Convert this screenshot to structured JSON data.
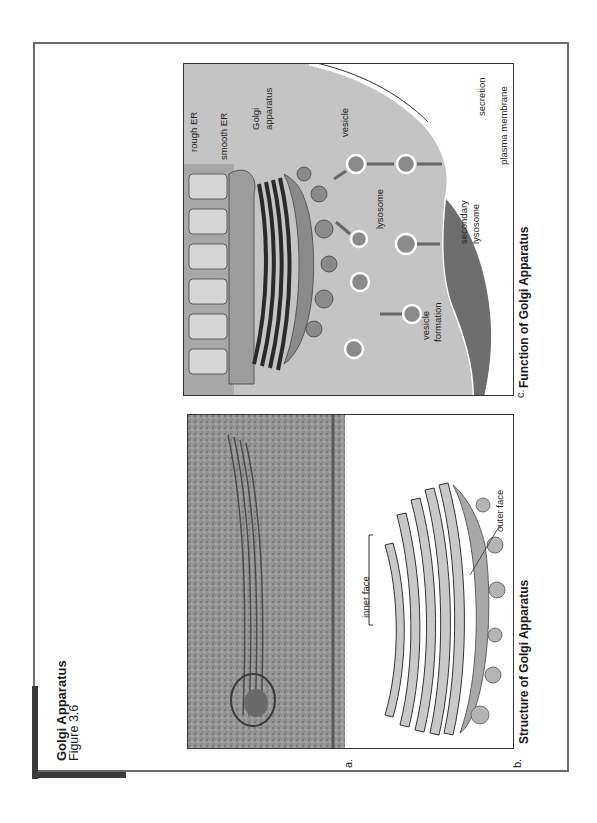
{
  "figure": {
    "title": "Golgi Apparatus",
    "subtitle": "Figure 3.6"
  },
  "panels": {
    "a": {
      "letter": "a.",
      "description": "electron micrograph"
    },
    "b": {
      "letter": "b.",
      "caption": "Structure of Golgi Apparatus",
      "labels": {
        "inner_face": "inner face",
        "outer_face": "outer face"
      }
    },
    "c": {
      "letter": "c.",
      "caption": "Function of Golgi Apparatus",
      "labels": {
        "rough_er": "rough ER",
        "smooth_er": "smooth ER",
        "golgi_line1": "Golgi",
        "golgi_line2": "apparatus",
        "vesicle": "vesicle",
        "lysosome": "lysosome",
        "secretion": "secretion",
        "plasma_membrane": "plasma membrane",
        "secondary_line1": "secondary",
        "secondary_line2": "lysosome",
        "vesicle_formation_line1": "vesicle",
        "vesicle_formation_line2": "formation"
      }
    }
  },
  "colors": {
    "frame": "#6b6b6b",
    "corner_bar": "#3a3a3a",
    "cytoplasm": "#c4c4c4",
    "golgi": "#8a8a8a",
    "membrane_dark": "#6e6e6e"
  }
}
